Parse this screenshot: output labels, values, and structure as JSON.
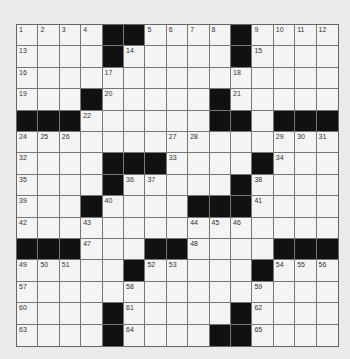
{
  "puzzle": {
    "rows": 15,
    "cols": 15,
    "grid": [
      "....##....#....",
      "....#.....#....",
      "...............",
      "...#.....#.....",
      "###......##.###",
      "...............",
      "....###....#...",
      "....#.....#....",
      "...#....###....",
      "...............",
      "###...##....###",
      ".....#.....#...",
      "...............",
      "....#.....#....",
      "....#....##...."
    ],
    "numbers": [
      [
        1,
        2,
        3,
        4,
        0,
        0,
        5,
        6,
        7,
        8,
        0,
        9,
        10,
        11,
        12
      ],
      [
        13,
        0,
        0,
        0,
        0,
        14,
        0,
        0,
        0,
        0,
        0,
        15,
        0,
        0,
        0
      ],
      [
        16,
        0,
        0,
        0,
        17,
        0,
        0,
        0,
        0,
        0,
        18,
        0,
        0,
        0,
        0
      ],
      [
        19,
        0,
        0,
        0,
        20,
        0,
        0,
        0,
        0,
        0,
        21,
        0,
        0,
        0,
        0
      ],
      [
        0,
        0,
        0,
        22,
        0,
        0,
        0,
        0,
        0,
        23,
        0,
        0,
        0,
        0,
        0
      ],
      [
        24,
        25,
        26,
        0,
        0,
        0,
        0,
        27,
        28,
        0,
        0,
        0,
        29,
        30,
        31
      ],
      [
        32,
        0,
        0,
        0,
        0,
        0,
        0,
        33,
        0,
        0,
        0,
        0,
        34,
        0,
        0
      ],
      [
        35,
        0,
        0,
        0,
        0,
        36,
        37,
        0,
        0,
        0,
        0,
        38,
        0,
        0,
        0
      ],
      [
        39,
        0,
        0,
        0,
        40,
        0,
        0,
        0,
        0,
        0,
        0,
        41,
        0,
        0,
        0
      ],
      [
        42,
        0,
        0,
        43,
        0,
        0,
        0,
        0,
        44,
        45,
        46,
        0,
        0,
        0,
        0
      ],
      [
        0,
        0,
        0,
        47,
        0,
        0,
        0,
        0,
        48,
        0,
        0,
        0,
        0,
        0,
        0
      ],
      [
        49,
        50,
        51,
        0,
        0,
        0,
        52,
        53,
        0,
        0,
        0,
        0,
        54,
        55,
        56
      ],
      [
        57,
        0,
        0,
        0,
        0,
        58,
        0,
        0,
        0,
        0,
        0,
        59,
        0,
        0,
        0
      ],
      [
        60,
        0,
        0,
        0,
        0,
        61,
        0,
        0,
        0,
        0,
        0,
        62,
        0,
        0,
        0
      ],
      [
        63,
        0,
        0,
        0,
        0,
        64,
        0,
        0,
        0,
        0,
        0,
        65,
        0,
        0,
        0
      ]
    ]
  }
}
